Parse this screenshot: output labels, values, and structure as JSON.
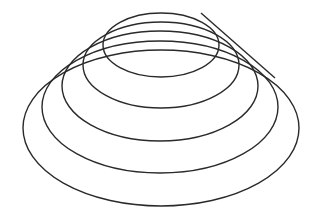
{
  "figure": {
    "stroke_color": "#2a2a2a",
    "background": "#ffffff",
    "turns": [
      {
        "cx": 161,
        "cy": 45,
        "rx": 58,
        "ry": 32
      },
      {
        "cx": 161,
        "cy": 65,
        "rx": 78,
        "ry": 43
      },
      {
        "cx": 160,
        "cy": 86,
        "rx": 98,
        "ry": 55
      },
      {
        "cx": 160,
        "cy": 107,
        "rx": 118,
        "ry": 66
      },
      {
        "cx": 161,
        "cy": 128,
        "rx": 138,
        "ry": 78
      }
    ],
    "tail": {
      "x1": 201,
      "y1": 13,
      "x2": 275,
      "y2": 78
    }
  }
}
